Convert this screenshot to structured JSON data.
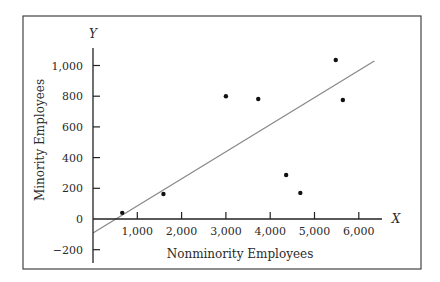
{
  "chart_data": {
    "type": "scatter",
    "title": "",
    "xlabel": "Nonminority Employees",
    "ylabel": "Minority Employees",
    "x_axis_letter": "X",
    "y_axis_letter": "Y",
    "xlim": [
      0,
      6500
    ],
    "ylim": [
      -200,
      1100
    ],
    "x_ticks": [
      1000,
      2000,
      3000,
      4000,
      5000,
      6000
    ],
    "x_tick_labels": [
      "1,000",
      "2,000",
      "3,000",
      "4,000",
      "5,000",
      "6,000"
    ],
    "y_ticks": [
      -200,
      0,
      200,
      400,
      600,
      800,
      1000
    ],
    "y_tick_labels": [
      "−200",
      "0",
      "200",
      "400",
      "600",
      "800",
      "1,000"
    ],
    "grid": false,
    "legend": null,
    "points": [
      {
        "x": 660,
        "y": 40
      },
      {
        "x": 1590,
        "y": 163
      },
      {
        "x": 3000,
        "y": 800
      },
      {
        "x": 3730,
        "y": 782
      },
      {
        "x": 4360,
        "y": 287
      },
      {
        "x": 4680,
        "y": 170
      },
      {
        "x": 5480,
        "y": 1036
      },
      {
        "x": 5640,
        "y": 775
      }
    ],
    "regression_line": {
      "x0": 0,
      "y0": -91,
      "x1": 6350,
      "y1": 1030,
      "color": "#888888"
    },
    "point_color": "#111111",
    "axis_color": "#222222"
  },
  "layout": {
    "frame": {
      "x": 23,
      "y": 16,
      "w": 398,
      "h": 253
    },
    "origin_px": {
      "x": 93,
      "y": 219
    },
    "px_per_x_unit": 0.0443,
    "px_per_y_unit": 0.1535
  }
}
